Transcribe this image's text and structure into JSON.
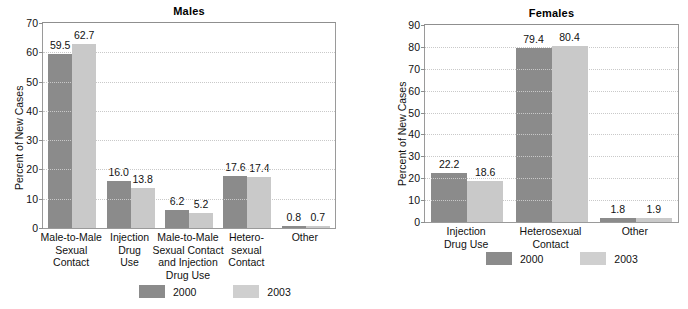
{
  "chart_data": [
    {
      "type": "bar",
      "title": "Males",
      "xlabel": "",
      "ylabel": "Percent of New Cases",
      "ylim": [
        0,
        70
      ],
      "yticks": [
        0,
        10,
        20,
        30,
        40,
        50,
        60,
        70
      ],
      "grid": true,
      "legend_position": "bottom-center",
      "categories": [
        "Male-to-Male Sexual Contact",
        "Injection Drug Use",
        "Male-to-Male Sexual Contact and Injection Drug Use",
        "Heterosexual Contact",
        "Other"
      ],
      "category_lines": [
        [
          "Male-to-Male",
          "Sexual",
          "Contact"
        ],
        [
          "Injection",
          "Drug",
          "Use"
        ],
        [
          "Male-to-Male",
          "Sexual Contact",
          "and Injection",
          "Drug Use"
        ],
        [
          "Hetero-",
          "sexual",
          "Contact"
        ],
        [
          "Other"
        ]
      ],
      "series": [
        {
          "name": "2000",
          "color": "#8b8b8b",
          "values": [
            59.5,
            16.0,
            6.2,
            17.6,
            0.8
          ]
        },
        {
          "name": "2003",
          "color": "#c9c9c9",
          "values": [
            62.7,
            13.8,
            5.2,
            17.4,
            0.7
          ]
        }
      ],
      "value_labels": {
        "2000": [
          "59.5",
          "16.0",
          "6.2",
          "17.6",
          "0.8"
        ],
        "2003": [
          "62.7",
          "13.8",
          "5.2",
          "17.4",
          "0.7"
        ]
      }
    },
    {
      "type": "bar",
      "title": "Females",
      "xlabel": "",
      "ylabel": "Percent of New Cases",
      "ylim": [
        0,
        90
      ],
      "yticks": [
        0,
        10,
        20,
        30,
        40,
        50,
        60,
        70,
        80,
        90
      ],
      "grid": true,
      "legend_position": "bottom-center",
      "categories": [
        "Injection Drug Use",
        "Heterosexual Contact",
        "Other"
      ],
      "category_lines": [
        [
          "Injection",
          "Drug Use"
        ],
        [
          "Heterosexual",
          "Contact"
        ],
        [
          "Other"
        ]
      ],
      "series": [
        {
          "name": "2000",
          "color": "#8b8b8b",
          "values": [
            22.2,
            79.4,
            1.8
          ]
        },
        {
          "name": "2003",
          "color": "#c9c9c9",
          "values": [
            18.6,
            80.4,
            1.9
          ]
        }
      ],
      "value_labels": {
        "2000": [
          "22.2",
          "79.4",
          "1.8"
        ],
        "2003": [
          "18.6",
          "80.4",
          "1.9"
        ]
      }
    }
  ],
  "legend": {
    "items": [
      {
        "label": "2000",
        "color": "#8b8b8b"
      },
      {
        "label": "2003",
        "color": "#c9c9c9"
      }
    ]
  }
}
